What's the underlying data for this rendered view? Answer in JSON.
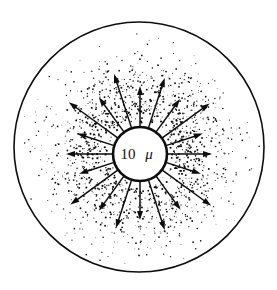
{
  "figure": {
    "background_color": "#ffffff",
    "ink_color": "#000000",
    "width": 277,
    "height": 290
  },
  "outer_boundary": {
    "name": "outer-circle",
    "center_x": 139,
    "center_y": 147,
    "radius": 125,
    "stroke_width": 1.6,
    "stroke_color": "#0d0d0d",
    "fill": "none"
  },
  "source_body": {
    "name": "inner-circle",
    "center_x": 140,
    "center_y": 154,
    "radius": 27,
    "stroke_width": 2.6,
    "stroke_color": "#0d0d0d",
    "fill": "#ffffff"
  },
  "scale_label": {
    "value": "10",
    "unit": "μ",
    "full_text": "10 μ",
    "x": 140,
    "y": 159
  },
  "arrows": {
    "count": 20,
    "stroke_color": "#0d0d0d",
    "shaft_width": 1.5,
    "head_length": 9,
    "head_width": 6,
    "origin_radius": 28,
    "items": [
      {
        "angle_deg": 0,
        "length": 44
      },
      {
        "angle_deg": 18,
        "length": 38
      },
      {
        "angle_deg": 36,
        "length": 58
      },
      {
        "angle_deg": 54,
        "length": 40
      },
      {
        "angle_deg": 72,
        "length": 52
      },
      {
        "angle_deg": 90,
        "length": 40
      },
      {
        "angle_deg": 108,
        "length": 56
      },
      {
        "angle_deg": 126,
        "length": 42
      },
      {
        "angle_deg": 144,
        "length": 60
      },
      {
        "angle_deg": 162,
        "length": 38
      },
      {
        "angle_deg": 180,
        "length": 46
      },
      {
        "angle_deg": 198,
        "length": 36
      },
      {
        "angle_deg": 216,
        "length": 58
      },
      {
        "angle_deg": 234,
        "length": 42
      },
      {
        "angle_deg": 252,
        "length": 50
      },
      {
        "angle_deg": 270,
        "length": 38
      },
      {
        "angle_deg": 288,
        "length": 52
      },
      {
        "angle_deg": 306,
        "length": 41
      },
      {
        "angle_deg": 324,
        "length": 60
      },
      {
        "angle_deg": 342,
        "length": 36
      }
    ]
  },
  "stipple": {
    "name": "particle-cloud",
    "description": "Dot cloud, density highest near the source body and fading radially outward",
    "dot_color": "#0d0d0d",
    "inner_radius": 29,
    "outer_radius": 122,
    "dot_count": 1500,
    "min_dot_radius": 0.35,
    "max_dot_radius": 1.15,
    "density_falloff": 2.6,
    "seed": 20240517
  }
}
